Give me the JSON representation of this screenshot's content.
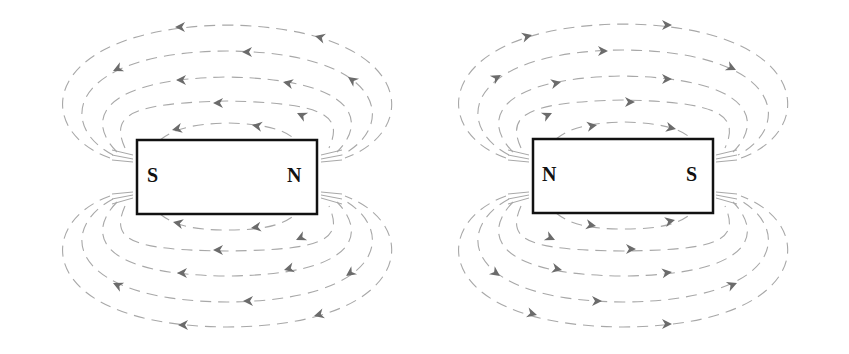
{
  "figure": {
    "line_color": "#a8a8a8",
    "arrow_color": "#6b6b6b",
    "magnet_border_color": "#111111"
  },
  "magnets": [
    {
      "id": "left",
      "left_pole": "S",
      "right_pole": "N",
      "field_direction": "right-to-left (arrows point left, from N around to S)",
      "field_loops_above": 5,
      "field_loops_below": 5
    },
    {
      "id": "right",
      "left_pole": "N",
      "right_pole": "S",
      "field_direction": "left-to-right (arrows point right, from N around to S)",
      "field_loops_above": 5,
      "field_loops_below": 5
    }
  ]
}
